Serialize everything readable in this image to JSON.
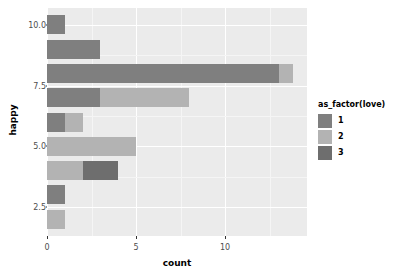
{
  "chart_data": {
    "type": "bar",
    "orientation": "horizontal",
    "stacked": true,
    "title": "",
    "subtitle": "",
    "xlabel": "count",
    "ylabel": "happy",
    "xlim": [
      0,
      14.6
    ],
    "ylim": [
      1.3,
      10.7
    ],
    "grid": true,
    "legend_position": "right",
    "legend_title": "as_factor(love)",
    "xticks": [
      0,
      5,
      10
    ],
    "xticklabels": [
      "0",
      "5",
      "10"
    ],
    "yticks": [
      2.5,
      5.0,
      7.5,
      10.0
    ],
    "yticklabels": [
      "2.5",
      "5.0",
      "7.5",
      "10.0"
    ],
    "categories": [
      10,
      9,
      8,
      7,
      6,
      5,
      4,
      3,
      2
    ],
    "series": [
      {
        "name": "1",
        "color": "#7f7f7f",
        "values": [
          1,
          3,
          13,
          3,
          1,
          0,
          0,
          1,
          0
        ]
      },
      {
        "name": "2",
        "color": "#b3b3b3",
        "values": [
          0,
          0,
          0.8,
          5,
          1,
          5,
          2,
          0,
          1
        ]
      },
      {
        "name": "3",
        "color": "#6e6e6e",
        "values": [
          0,
          0,
          0,
          0,
          0,
          0,
          2,
          0,
          0
        ]
      }
    ],
    "bars": [
      {
        "y": 10,
        "segments": [
          {
            "level": "1",
            "from": 0,
            "to": 1
          }
        ]
      },
      {
        "y": 9,
        "segments": [
          {
            "level": "1",
            "from": 0,
            "to": 3
          }
        ]
      },
      {
        "y": 8,
        "segments": [
          {
            "level": "1",
            "from": 0,
            "to": 13
          },
          {
            "level": "2",
            "from": 13,
            "to": 13.8
          }
        ]
      },
      {
        "y": 7,
        "segments": [
          {
            "level": "1",
            "from": 0,
            "to": 3
          },
          {
            "level": "2",
            "from": 3,
            "to": 8
          }
        ]
      },
      {
        "y": 6,
        "segments": [
          {
            "level": "1",
            "from": 0,
            "to": 1
          },
          {
            "level": "2",
            "from": 1,
            "to": 2
          }
        ]
      },
      {
        "y": 5,
        "segments": [
          {
            "level": "2",
            "from": 0,
            "to": 5
          }
        ]
      },
      {
        "y": 4,
        "segments": [
          {
            "level": "2",
            "from": 0,
            "to": 2
          },
          {
            "level": "3",
            "from": 2,
            "to": 4
          }
        ]
      },
      {
        "y": 3,
        "segments": [
          {
            "level": "1",
            "from": 0,
            "to": 1
          }
        ]
      },
      {
        "y": 2,
        "segments": [
          {
            "level": "2",
            "from": 0,
            "to": 1
          }
        ]
      }
    ],
    "panel_background": "#ebebeb",
    "gridline_color": "#ffffff",
    "plot_background": "#ffffff"
  },
  "legend": {
    "title": "as_factor(love)",
    "items": [
      {
        "label": "1",
        "color": "#7f7f7f"
      },
      {
        "label": "2",
        "color": "#b3b3b3"
      },
      {
        "label": "3",
        "color": "#6e6e6e"
      }
    ]
  },
  "axes": {
    "x_title": "count",
    "y_title": "happy"
  }
}
